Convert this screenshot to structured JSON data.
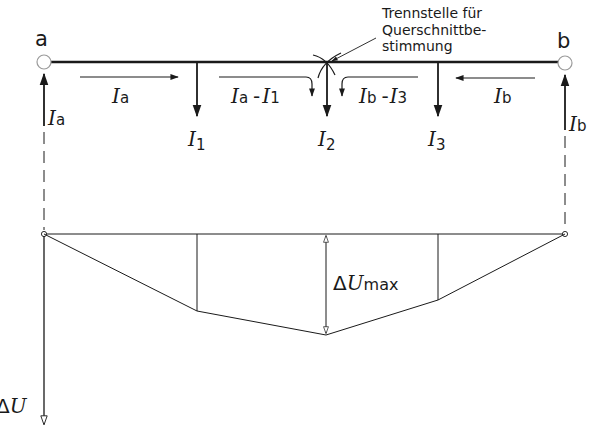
{
  "diagram": {
    "type": "line-voltage-drop",
    "nodes": {
      "a": {
        "label": "a",
        "current": "I",
        "current_sub": "a"
      },
      "b": {
        "label": "b",
        "current": "I",
        "current_sub": "b"
      }
    },
    "annotation": {
      "line1": "Trennstelle für",
      "line2": "Querschnittbe-",
      "line3": "stimmung"
    },
    "segments": {
      "seg1": {
        "main": "I",
        "sub": "a"
      },
      "seg2": {
        "main1": "I",
        "sub1": "a",
        "op": "-",
        "main2": "I",
        "sub2": "1"
      },
      "seg3": {
        "main1": "I",
        "sub1": "b",
        "op": "-",
        "main2": "I",
        "sub2": "3"
      },
      "seg4": {
        "main": "I",
        "sub": "b"
      }
    },
    "loads": [
      {
        "main": "I",
        "sub": "1"
      },
      {
        "main": "I",
        "sub": "2"
      },
      {
        "main": "I",
        "sub": "3"
      }
    ],
    "voltage_axis": {
      "delta": "Δ",
      "main": "U"
    },
    "max_drop": {
      "delta": "Δ",
      "main": "U",
      "sub": "max"
    },
    "colors": {
      "ink": "#1a1a1a",
      "background": "#ffffff"
    }
  }
}
